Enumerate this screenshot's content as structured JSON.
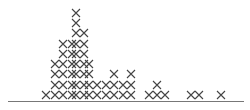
{
  "chart_data": {
    "type": "scatter",
    "subtype": "dot-plot (x marks)",
    "title": "",
    "xlabel": "",
    "ylabel": "",
    "marker": "x",
    "marker_color": "#444444",
    "axis_color": "#777777",
    "grid": false,
    "legend": null,
    "columns": [
      {
        "x": 46,
        "count": 1
      },
      {
        "x": 55,
        "count": 4
      },
      {
        "x": 63,
        "count": 6
      },
      {
        "x": 72,
        "count": 6
      },
      {
        "x": 76,
        "count": 9
      },
      {
        "x": 84,
        "count": 7
      },
      {
        "x": 89,
        "count": 4
      },
      {
        "x": 97,
        "count": 2
      },
      {
        "x": 106,
        "count": 2
      },
      {
        "x": 114,
        "count": 3
      },
      {
        "x": 123,
        "count": 2
      },
      {
        "x": 131,
        "count": 3
      },
      {
        "x": 149,
        "count": 1
      },
      {
        "x": 157,
        "count": 2
      },
      {
        "x": 165,
        "count": 1
      },
      {
        "x": 191,
        "count": 1
      },
      {
        "x": 199,
        "count": 1
      },
      {
        "x": 221,
        "count": 1
      }
    ],
    "row_baseline_y": 95,
    "row_spacing": 10.3
  }
}
